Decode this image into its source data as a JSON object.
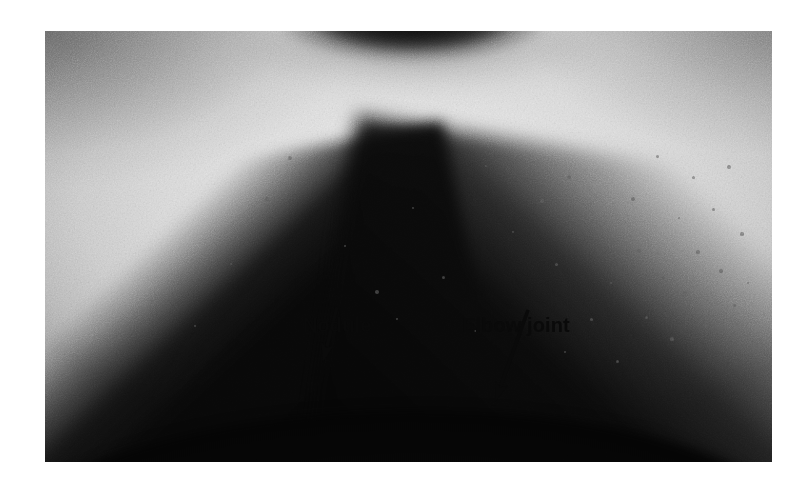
{
  "figure": {
    "kind": "clinical-photograph",
    "colors": {
      "page_background": "#ffffff",
      "skin_highlight": "#ececec",
      "skin_midtone": "#dcdcdc",
      "shadow_dark": "#080808",
      "annotation_ink": "#0a0a0a"
    },
    "plate": {
      "left": 45,
      "top": 31,
      "width": 727,
      "height": 431
    }
  },
  "annotations": [
    {
      "id": "nodule",
      "label": "Nodule",
      "label_left": 258,
      "label_top": 284,
      "arrow": {
        "x1": 292,
        "y1": 276,
        "x2": 278,
        "y2": 331,
        "head_width": 13,
        "head_length": 19
      }
    },
    {
      "id": "elbow-joint",
      "label": "Elbow joint",
      "label_left": 417,
      "label_top": 284,
      "arrow": {
        "x1": 483,
        "y1": 279,
        "x2": 450,
        "y2": 371,
        "head_width": 13,
        "head_length": 20
      }
    }
  ],
  "freckles": [
    {
      "x": 245,
      "y": 127,
      "r": 2.0
    },
    {
      "x": 222,
      "y": 168,
      "r": 1.6
    },
    {
      "x": 300,
      "y": 215,
      "r": 1.4
    },
    {
      "x": 332,
      "y": 261,
      "r": 1.9
    },
    {
      "x": 352,
      "y": 288,
      "r": 1.3
    },
    {
      "x": 398,
      "y": 246,
      "r": 1.5
    },
    {
      "x": 430,
      "y": 300,
      "r": 1.4
    },
    {
      "x": 468,
      "y": 201,
      "r": 1.4
    },
    {
      "x": 497,
      "y": 170,
      "r": 1.6
    },
    {
      "x": 511,
      "y": 233,
      "r": 1.5
    },
    {
      "x": 524,
      "y": 146,
      "r": 2.1
    },
    {
      "x": 546,
      "y": 288,
      "r": 1.5
    },
    {
      "x": 556,
      "y": 196,
      "r": 1.7
    },
    {
      "x": 566,
      "y": 252,
      "r": 1.4
    },
    {
      "x": 572,
      "y": 330,
      "r": 1.5
    },
    {
      "x": 588,
      "y": 168,
      "r": 1.8
    },
    {
      "x": 594,
      "y": 220,
      "r": 1.6
    },
    {
      "x": 601,
      "y": 286,
      "r": 1.5
    },
    {
      "x": 612,
      "y": 125,
      "r": 1.5
    },
    {
      "x": 618,
      "y": 247,
      "r": 1.7
    },
    {
      "x": 627,
      "y": 308,
      "r": 1.6
    },
    {
      "x": 634,
      "y": 187,
      "r": 1.4
    },
    {
      "x": 640,
      "y": 262,
      "r": 2.0
    },
    {
      "x": 648,
      "y": 146,
      "r": 1.5
    },
    {
      "x": 653,
      "y": 221,
      "r": 1.6
    },
    {
      "x": 661,
      "y": 295,
      "r": 1.7
    },
    {
      "x": 668,
      "y": 178,
      "r": 1.5
    },
    {
      "x": 676,
      "y": 240,
      "r": 1.6
    },
    {
      "x": 684,
      "y": 136,
      "r": 1.9
    },
    {
      "x": 689,
      "y": 274,
      "r": 1.5
    },
    {
      "x": 697,
      "y": 203,
      "r": 1.6
    },
    {
      "x": 703,
      "y": 252,
      "r": 1.4
    },
    {
      "x": 279,
      "y": 318,
      "r": 1.4
    },
    {
      "x": 186,
      "y": 233,
      "r": 1.3
    },
    {
      "x": 150,
      "y": 295,
      "r": 1.4
    },
    {
      "x": 368,
      "y": 177,
      "r": 1.3
    },
    {
      "x": 441,
      "y": 135,
      "r": 1.4
    },
    {
      "x": 520,
      "y": 321,
      "r": 1.4
    }
  ]
}
